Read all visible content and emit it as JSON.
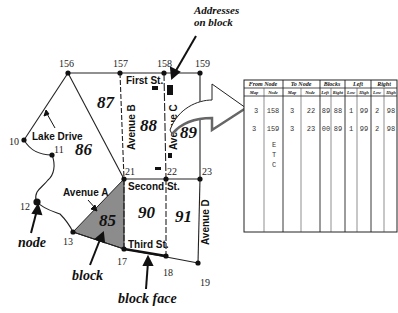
{
  "callouts": {
    "addresses": [
      "Addresses",
      "on block"
    ],
    "node": "node",
    "block": "block",
    "block_face": "block face"
  },
  "nodes": {
    "n156": "156",
    "n157": "157",
    "n158": "158",
    "n159": "159",
    "n10": "10",
    "n11": "11",
    "n12": "12",
    "n13": "13",
    "n17": "17",
    "n18": "18",
    "n19": "19",
    "n21": "21",
    "n22": "22",
    "n23": "23"
  },
  "streets": {
    "first": "First St.",
    "second": "Second St.",
    "third": "Third St.",
    "lake_drive": "Lake Drive",
    "avenue_a": "Avenue A",
    "avenue_b": "Avenue B",
    "avenue_c": "Avenue C",
    "avenue_d": "Avenue D"
  },
  "blocks": {
    "b85": "85",
    "b86": "86",
    "b87": "87",
    "b88": "88",
    "b89": "89",
    "b90": "90",
    "b91": "91"
  },
  "colors": {
    "highlight_block": "#8c8c8c",
    "lines": "#222222"
  },
  "table": {
    "groups": [
      "From Node",
      "To Node",
      "Blocks",
      "Left",
      "Right"
    ],
    "columns": [
      "Map",
      "Node",
      "Map",
      "Node",
      "Left",
      "Right",
      "Low",
      "High",
      "Low",
      "High"
    ],
    "rows": [
      [
        "3",
        "158",
        "3",
        "22",
        "89",
        "88",
        "1",
        "99",
        "2",
        "98"
      ],
      [
        "3",
        "159",
        "3",
        "23",
        "00",
        "89",
        "1",
        "99",
        "2",
        "98"
      ]
    ],
    "etc": [
      "E",
      "T",
      "C"
    ]
  }
}
